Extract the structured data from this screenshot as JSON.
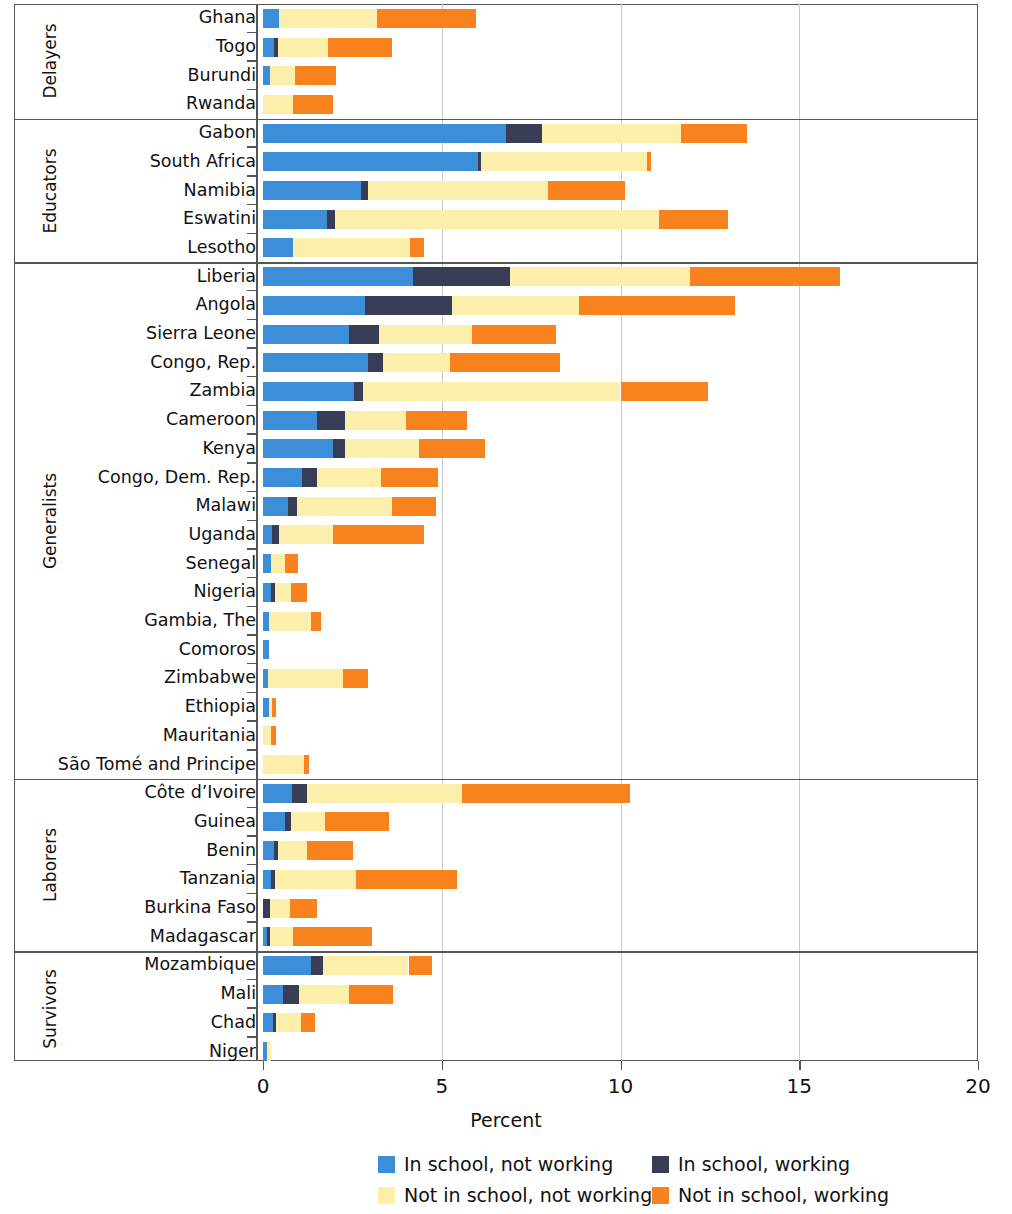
{
  "chart_data": {
    "type": "bar",
    "orientation": "horizontal",
    "stacked": true,
    "title": "",
    "xlabel": "Percent",
    "ylabel": "",
    "xlim": [
      0,
      20
    ],
    "xticks": [
      0,
      5,
      10,
      15,
      20
    ],
    "xticklabels": [
      "0",
      "5",
      "10",
      "15",
      "20"
    ],
    "grid": "vertical",
    "legend_position": "bottom",
    "series": [
      {
        "name": "In school, not working",
        "key": "in_school_not_working",
        "color": "#3d8ed9"
      },
      {
        "name": "In school, working",
        "key": "in_school_working",
        "color": "#383c54"
      },
      {
        "name": "Not in school, not working",
        "key": "not_in_school_not_working",
        "color": "#fcefab"
      },
      {
        "name": "Not in school, working",
        "key": "not_in_school_working",
        "color": "#f7821e"
      }
    ],
    "groups": [
      {
        "name": "Delayers",
        "categories": [
          "Ghana",
          "Togo",
          "Burundi",
          "Rwanda"
        ],
        "values": [
          [
            0.45,
            0.0,
            2.75,
            2.75
          ],
          [
            0.3,
            0.12,
            1.4,
            1.8
          ],
          [
            0.2,
            0.0,
            0.7,
            1.15
          ],
          [
            0.0,
            0.0,
            0.85,
            1.1
          ]
        ]
      },
      {
        "name": "Educators",
        "categories": [
          "Gabon",
          "South Africa",
          "Namibia",
          "Eswatini",
          "Lesotho"
        ],
        "values": [
          [
            6.8,
            1.0,
            3.9,
            1.85
          ],
          [
            6.0,
            0.1,
            4.65,
            0.1
          ],
          [
            2.75,
            0.18,
            5.05,
            2.15
          ],
          [
            1.8,
            0.22,
            9.05,
            1.95
          ],
          [
            0.85,
            0.0,
            3.25,
            0.4
          ]
        ]
      },
      {
        "name": "Generalists",
        "categories": [
          "Liberia",
          "Angola",
          "Sierra Leone",
          "Congo, Rep.",
          "Zambia",
          "Cameroon",
          "Kenya",
          "Congo, Dem. Rep.",
          "Malawi",
          "Uganda",
          "Senegal",
          "Nigeria",
          "Gambia, The",
          "Comoros",
          "Zimbabwe",
          "Ethiopia",
          "Mauritania",
          "São Tomé and Principe"
        ],
        "values": [
          [
            4.2,
            2.7,
            5.05,
            4.2
          ],
          [
            2.85,
            2.45,
            3.55,
            4.35
          ],
          [
            2.4,
            0.85,
            2.6,
            2.35
          ],
          [
            2.95,
            0.42,
            1.85,
            3.1
          ],
          [
            2.55,
            0.25,
            7.2,
            2.45
          ],
          [
            1.5,
            0.8,
            1.7,
            1.7
          ],
          [
            1.95,
            0.35,
            2.05,
            1.85
          ],
          [
            1.1,
            0.4,
            1.8,
            1.6
          ],
          [
            0.7,
            0.25,
            2.65,
            1.25
          ],
          [
            0.25,
            0.2,
            1.5,
            2.55
          ],
          [
            0.22,
            0.0,
            0.4,
            0.35
          ],
          [
            0.22,
            0.12,
            0.45,
            0.45
          ],
          [
            0.18,
            0.0,
            1.15,
            0.28
          ],
          [
            0.16,
            0.0,
            0.0,
            0.0
          ],
          [
            0.14,
            0.0,
            2.1,
            0.7
          ],
          [
            0.16,
            0.0,
            0.08,
            0.12
          ],
          [
            0.0,
            0.0,
            0.22,
            0.14
          ],
          [
            0.0,
            0.0,
            1.15,
            0.14
          ]
        ]
      },
      {
        "name": "Laborers",
        "categories": [
          "Côte d’Ivoire",
          "Guinea",
          "Benin",
          "Tanzania",
          "Burkina Faso",
          "Madagascar"
        ],
        "values": [
          [
            0.82,
            0.4,
            4.35,
            4.7
          ],
          [
            0.62,
            0.16,
            0.95,
            1.8
          ],
          [
            0.32,
            0.1,
            0.8,
            1.3
          ],
          [
            0.22,
            0.12,
            2.25,
            2.85
          ],
          [
            0.0,
            0.2,
            0.55,
            0.75
          ],
          [
            0.12,
            0.08,
            0.65,
            2.2
          ]
        ]
      },
      {
        "name": "Survivors",
        "categories": [
          "Mozambique",
          "Mali",
          "Chad",
          "Niger"
        ],
        "values": [
          [
            1.35,
            0.32,
            2.4,
            0.65
          ],
          [
            0.55,
            0.45,
            1.4,
            1.25
          ],
          [
            0.28,
            0.08,
            0.7,
            0.4
          ],
          [
            0.1,
            0.0,
            0.12,
            0.0
          ]
        ]
      }
    ]
  },
  "axis": {
    "x_title": "Percent"
  },
  "legend": {
    "items": [
      {
        "label": "In school, not working",
        "color": "#3d8ed9"
      },
      {
        "label": "In school, working",
        "color": "#383c54"
      },
      {
        "label": "Not in school, not working",
        "color": "#fcefab"
      },
      {
        "label": "Not in school, working",
        "color": "#f7821e"
      }
    ]
  }
}
